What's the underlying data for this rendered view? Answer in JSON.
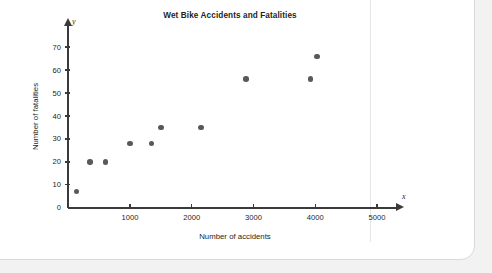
{
  "chart_data": {
    "type": "scatter",
    "title": "Wet Bike Accidents and Fatalities",
    "xlabel": "Number of accidents",
    "ylabel": "Number of fatalities",
    "axis_var_x": "x",
    "axis_var_y": "y",
    "xlim": [
      0,
      5400
    ],
    "ylim": [
      0,
      75
    ],
    "grid": false,
    "legend": null,
    "xticks": [
      {
        "value": 1000,
        "label": "1000"
      },
      {
        "value": 2000,
        "label": "2000"
      },
      {
        "value": 3000,
        "label": "3000"
      },
      {
        "value": 4000,
        "label": "4000"
      },
      {
        "value": 5000,
        "label": "5000"
      }
    ],
    "yticks": [
      {
        "value": 0,
        "label": "0"
      },
      {
        "value": 10,
        "label": "10"
      },
      {
        "value": 20,
        "label": "20"
      },
      {
        "value": 30,
        "label": "30"
      },
      {
        "value": 40,
        "label": "40"
      },
      {
        "value": 50,
        "label": "50"
      },
      {
        "value": 60,
        "label": "60"
      },
      {
        "value": 70,
        "label": "70"
      }
    ],
    "points": [
      {
        "x": 130,
        "y": 7
      },
      {
        "x": 350,
        "y": 20
      },
      {
        "x": 600,
        "y": 20
      },
      {
        "x": 1000,
        "y": 28
      },
      {
        "x": 1350,
        "y": 28
      },
      {
        "x": 1500,
        "y": 35
      },
      {
        "x": 2150,
        "y": 35
      },
      {
        "x": 2880,
        "y": 56
      },
      {
        "x": 3920,
        "y": 56
      },
      {
        "x": 4030,
        "y": 66
      }
    ],
    "marker_color": "#58595b",
    "axis_color": "#3a3a3a",
    "text_color": "#231f20",
    "background_color": "#ffffff"
  }
}
